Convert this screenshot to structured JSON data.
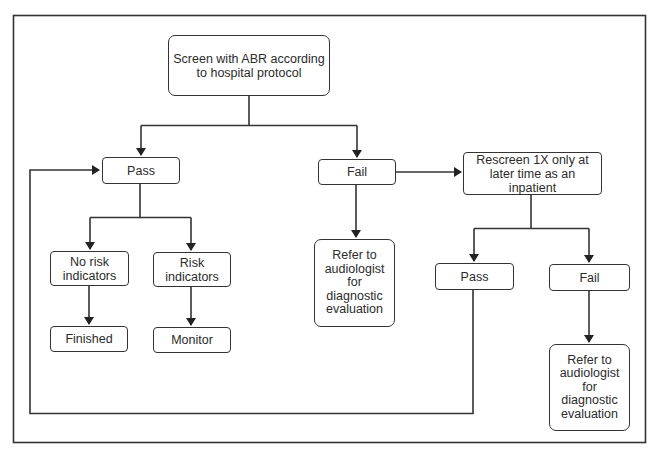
{
  "diagram": {
    "type": "flowchart",
    "nodes": {
      "start": {
        "label": "Screen with ABR according to hospital protocol"
      },
      "pass1": {
        "label": "Pass"
      },
      "fail1": {
        "label": "Fail"
      },
      "rescreen": {
        "label": "Rescreen 1X only at later time as an inpatient"
      },
      "no_risk": {
        "label": "No risk indicators"
      },
      "risk": {
        "label": "Risk indicators"
      },
      "finished": {
        "label": "Finished"
      },
      "monitor": {
        "label": "Monitor"
      },
      "refer1": {
        "label": "Refer to audiologist for diagnostic evaluation"
      },
      "pass2": {
        "label": "Pass"
      },
      "fail2": {
        "label": "Fail"
      },
      "refer2": {
        "label": "Refer to audiologist for diagnostic evaluation"
      }
    },
    "edges": [
      {
        "from": "start",
        "to": "pass1"
      },
      {
        "from": "start",
        "to": "fail1"
      },
      {
        "from": "pass1",
        "to": "no_risk"
      },
      {
        "from": "pass1",
        "to": "risk"
      },
      {
        "from": "no_risk",
        "to": "finished"
      },
      {
        "from": "risk",
        "to": "monitor"
      },
      {
        "from": "fail1",
        "to": "refer1"
      },
      {
        "from": "fail1",
        "to": "rescreen"
      },
      {
        "from": "rescreen",
        "to": "pass2"
      },
      {
        "from": "rescreen",
        "to": "fail2"
      },
      {
        "from": "fail2",
        "to": "refer2"
      },
      {
        "from": "pass2",
        "to": "pass1"
      }
    ],
    "colors": {
      "line": "#333333",
      "background": "#ffffff"
    }
  }
}
